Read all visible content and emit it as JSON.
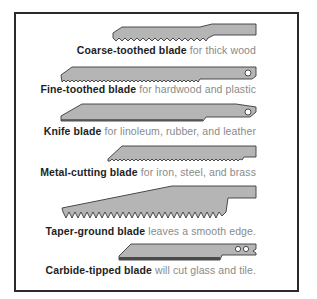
{
  "colors": {
    "blade_fill": "#b5b5b5",
    "blade_stroke": "#3a3a3a",
    "frame": "#2a2a2a",
    "caption_bold": "#1e1e1e",
    "caption_light": "#8a8a8a"
  },
  "blades": [
    {
      "name": "Coarse-toothed blade",
      "desc": " for thick wood"
    },
    {
      "name": "Fine-toothed blade",
      "desc": " for hardwood and plastic"
    },
    {
      "name": "Knife blade",
      "desc": " for linoleum, rubber, and leather"
    },
    {
      "name": "Metal-cutting blade",
      "desc": " for iron, steel, and brass"
    },
    {
      "name": "Taper-ground blade",
      "desc": " leaves a smooth edge."
    },
    {
      "name": "Carbide-tipped blade",
      "desc": " will cut glass and tile."
    }
  ]
}
